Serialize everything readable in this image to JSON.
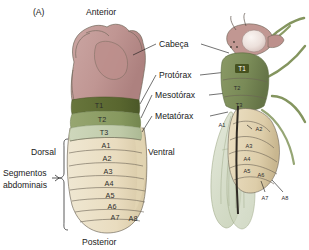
{
  "figure": {
    "panel_label": "(A)",
    "orientation": {
      "anterior": "Anterior",
      "posterior": "Posterior",
      "dorsal": "Dorsal",
      "ventral": "Ventral"
    },
    "bracket_label_line1": "Segmentos",
    "bracket_label_line2": "abdominais",
    "callouts": [
      {
        "id": "cabeca",
        "label": "Cabeça"
      },
      {
        "id": "protorax",
        "label": "Protórax"
      },
      {
        "id": "mesotorax",
        "label": "Mesotórax"
      },
      {
        "id": "metatorax",
        "label": "Metatórax"
      }
    ],
    "larva": {
      "name": "larva-drosophila",
      "thoracic_segments": [
        "T1",
        "T2",
        "T3"
      ],
      "abdominal_segments": [
        "A1",
        "A2",
        "A3",
        "A4",
        "A5",
        "A6",
        "A7",
        "A8"
      ]
    },
    "adult": {
      "name": "adulto-drosophila",
      "thoracic_segments": [
        "T1",
        "T2",
        "T3"
      ],
      "abdominal_segments": [
        "A1",
        "A2",
        "A3",
        "A4",
        "A5",
        "A6",
        "A7",
        "A8"
      ]
    },
    "colors": {
      "background": "#ffffff",
      "head": "#c39a97",
      "head_shade": "#b88c89",
      "t1": "#5d6b34",
      "t2": "#8a9b63",
      "t3": "#c3cdb0",
      "abdomen": "#ece2c8",
      "abdomen_shade": "#ded2b2",
      "adult_thorax": "#7f8f5c",
      "adult_abdomen": "#e4d5b5",
      "wing": "#d6ddc8",
      "leg": "#8b9c66",
      "eye": "#efe6e2",
      "outline": "#6b6355",
      "text": "#1a1a1a"
    }
  }
}
